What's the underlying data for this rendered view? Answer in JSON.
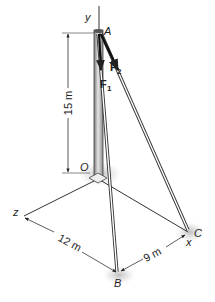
{
  "figure": {
    "points": {
      "A": "A",
      "O": "O",
      "B": "B",
      "C": "C"
    },
    "axes": {
      "x": "x",
      "y": "y",
      "z": "z"
    },
    "forces": {
      "F1": "F",
      "F1_sub": "1",
      "F2": "F",
      "F2_sub": "2"
    },
    "dimensions": {
      "height": "15 m",
      "OB_z": "12 m",
      "BC_x": "9 m"
    },
    "colors": {
      "line": "#333333",
      "pole": "#9a9a9a",
      "shadow": "#c8c8c8"
    }
  }
}
